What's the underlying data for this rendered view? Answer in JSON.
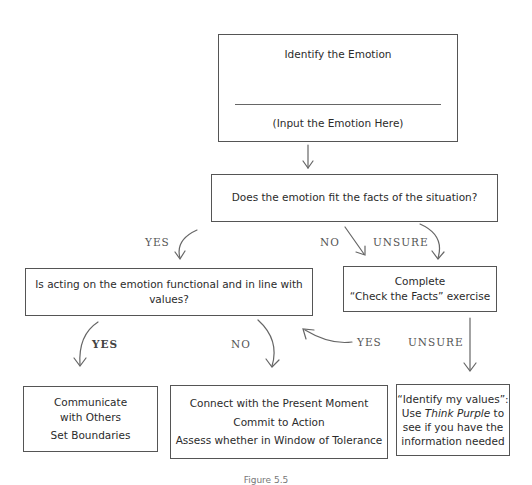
{
  "diagram": {
    "identify_box": {
      "title": "Identify the Emotion",
      "input_placeholder": "(Input the Emotion Here)"
    },
    "fit_facts_box": {
      "text": "Does the emotion fit the facts of the situation?"
    },
    "functional_box": {
      "text": "Is acting on the emotion functional and in line with values?"
    },
    "check_facts_box": {
      "line1": "Complete",
      "line2": "“Check the Facts” exercise"
    },
    "communicate_box": {
      "line1": "Communicate",
      "line2": "with Others",
      "line3": "Set Boundaries"
    },
    "connect_box": {
      "line1": "Connect with the Present Moment",
      "line2": "Commit to Action",
      "line3": "Assess whether in Window of Tolerance"
    },
    "values_box": {
      "line1": "“Identify my values”:",
      "line2_pre": "Use ",
      "line2_em": "Think Purple",
      "line2_post": " to",
      "line3": "see if you have the",
      "line4": "information needed"
    },
    "edge_labels": {
      "fit_yes": "YES",
      "fit_no": "NO",
      "fit_unsure": "UNSURE",
      "functional_yes": "YES",
      "functional_no": "NO",
      "check_yes": "YES",
      "check_unsure": "UNSURE"
    },
    "caption": "Figure 5.5"
  }
}
